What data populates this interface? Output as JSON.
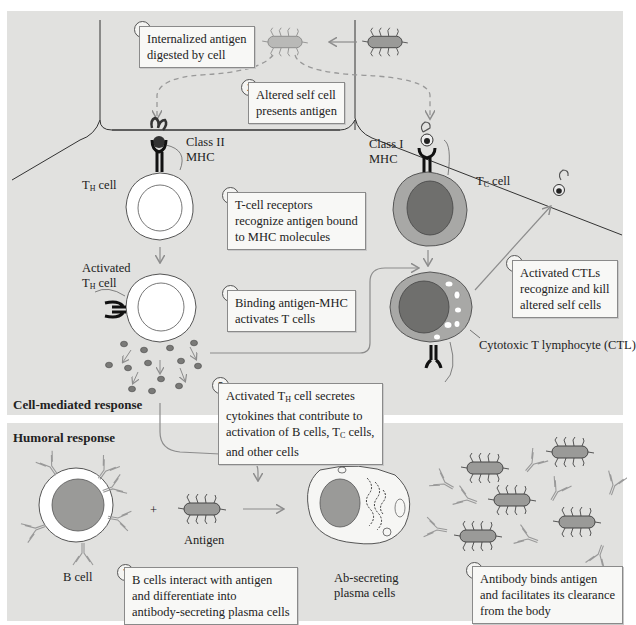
{
  "figure": {
    "sections": {
      "cell_mediated": "Cell-mediated response",
      "humoral": "Humoral response"
    },
    "steps": [
      {
        "number": "1",
        "lines": [
          "Internalized antigen",
          "digested by cell"
        ]
      },
      {
        "number": "2",
        "lines": [
          "Altered self cell",
          "presents antigen"
        ]
      },
      {
        "number": "3",
        "lines": [
          "T-cell receptors",
          "recognize antigen bound",
          "to MHC molecules"
        ]
      },
      {
        "number": "4",
        "lines": [
          "Binding antigen-MHC",
          "activates T cells"
        ]
      },
      {
        "number": "5",
        "lines": [
          "Activated T",
          "cell secretes",
          "cytokines that contribute to",
          "activation of B cells, T",
          "cells,",
          "and other cells"
        ],
        "subscripts": [
          "H",
          "C"
        ]
      },
      {
        "number": "6",
        "lines": [
          "Activated CTLs",
          "recognize and kill",
          "altered self cells"
        ]
      },
      {
        "number": "7",
        "lines": [
          "B cells interact with antigen",
          "and differentiate into",
          "antibody-secreting plasma cells"
        ]
      },
      {
        "number": "8",
        "lines": [
          "Antibody binds antigen",
          "and facilitates its clearance",
          "from the body"
        ]
      }
    ],
    "labels": {
      "class_ii": "Class II",
      "class_i": "Class I",
      "mhc": "MHC",
      "th_cell_t": "T",
      "th_cell_sub": "H",
      "th_cell_rest": " cell",
      "activated": "Activated",
      "tc_cell_t": "T",
      "tc_cell_sub": "C",
      "tc_cell_rest": " cell",
      "ctl": "Cytotoxic T lymphocyte (CTL)",
      "b_cell": "B cell",
      "plus": "+",
      "antigen": "Antigen",
      "plasma_1": "Ab-secreting",
      "plasma_2": "plasma cells"
    },
    "colors": {
      "panel": "#e1e1df",
      "box": "#f8f8f6",
      "cell_membrane": "#ffffff",
      "nucleus": "#9a9a98",
      "tc_cytoplasm": "#a8a8a6",
      "tc_nucleus": "#6f6f6d",
      "receptor": "#222222",
      "arrow": "#8c8c8c"
    }
  }
}
